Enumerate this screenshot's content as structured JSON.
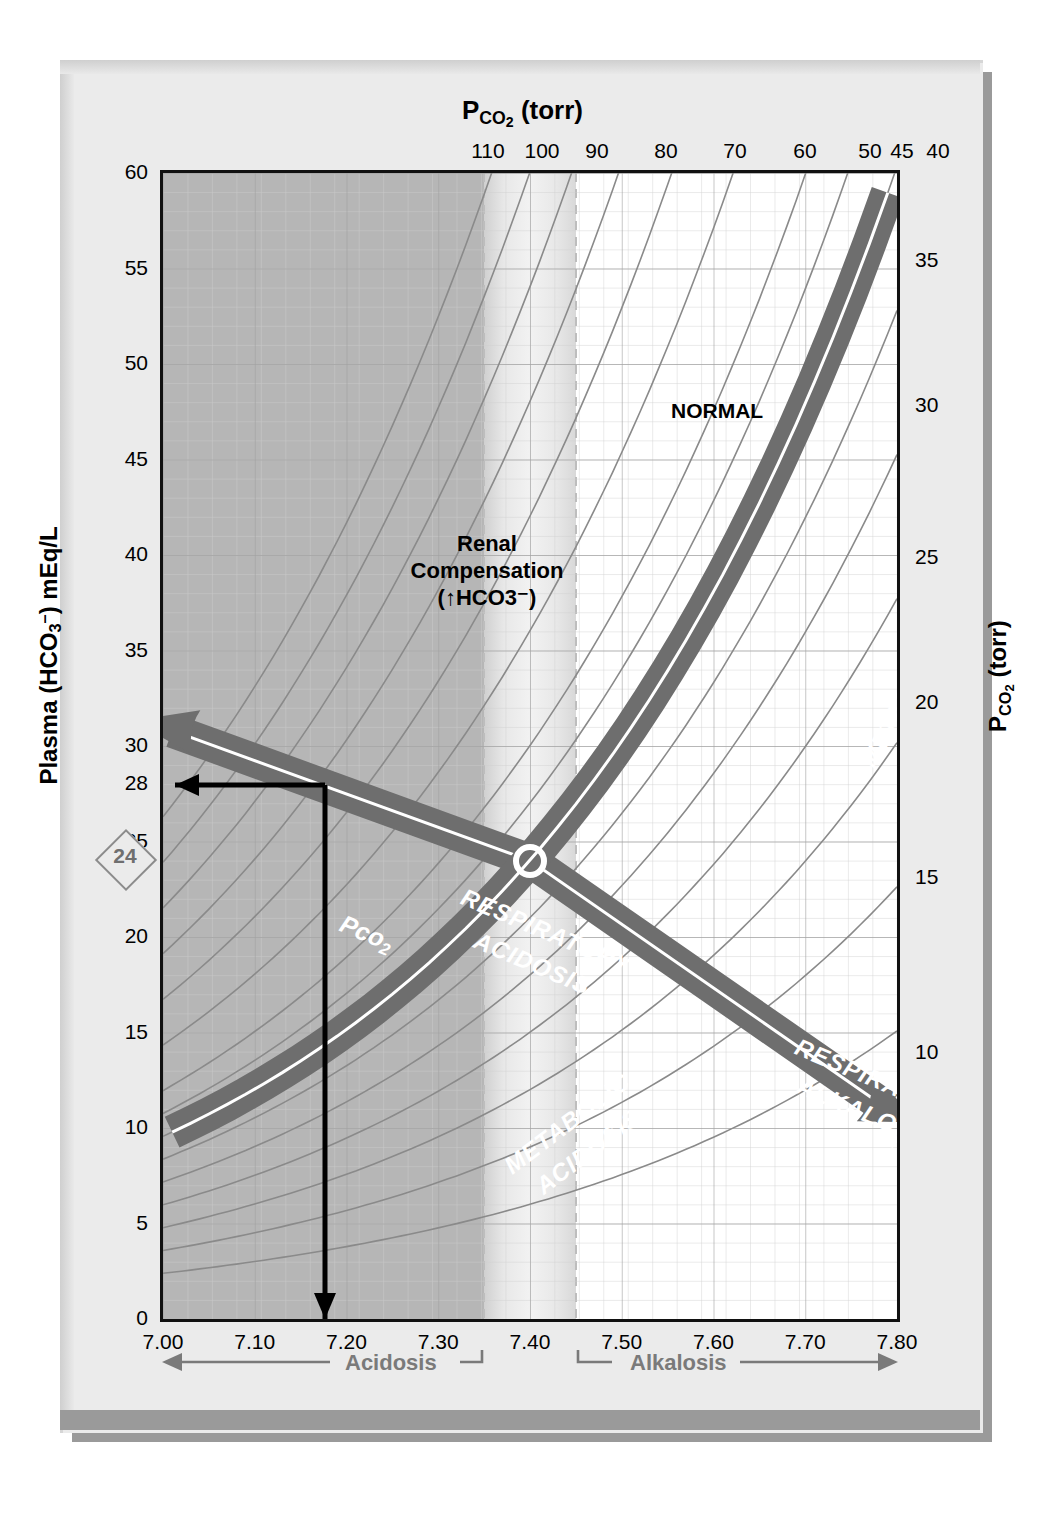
{
  "figure": {
    "kind": "acid-base-nomogram",
    "top_axis_title": "PCO2 (torr)",
    "bottom_axis_title": "Arterial pH",
    "left_axis_title": "Plasma (HCO3-) mEq/L",
    "right_axis_title": "PCO2 (torr)"
  },
  "annotations": {
    "normal_top": "NORMAL",
    "normal_bottom": "NORMAL",
    "renal_line1": "Renal",
    "renal_line2": "Compensation",
    "renal_line3": "(↑HCO3⁻)",
    "marker_value": "24",
    "acidosis": "Acidosis",
    "alkalosis": "Alkalosis",
    "band_respiratory_acidosis_l1": "RESPIRATORY",
    "band_respiratory_acidosis_l2": "ACIDOSIS",
    "band_respiratory_alkalosis_l1": "RESPIRATORY",
    "band_respiratory_alkalosis_l2": "ALKALOSIS",
    "band_metabolic_acidosis_l1": "METABOLIC",
    "band_metabolic_acidosis_l2": "ACIDOSIS",
    "band_metabolic_alkalosis_l1": "METABOLIC",
    "band_metabolic_alkalosis_l2": "ALKALOSIS",
    "arrow_label_left": "Pco2",
    "arrow_label_right": "Pco2"
  },
  "colors": {
    "band": "#6e6e6e",
    "plate": "#ebebeb",
    "shadow": "#9a9a9a",
    "grid_minor": "#c9c9c9",
    "grid_major": "#9e9e9e",
    "isobar": "#8a8a8a",
    "shade_renal": "#a8a8a8",
    "shade_normal": "#e2e2e2",
    "axis": "#111111",
    "construction": "#000000",
    "direction_text": "#7a7a7a"
  },
  "chart_data": {
    "type": "line",
    "xlabel": "Arterial pH",
    "ylabel": "Plasma (HCO3-) mEq/L",
    "xlim": [
      7.0,
      7.8
    ],
    "ylim": [
      0,
      60
    ],
    "grid": true,
    "legend": "none",
    "x_ticks": [
      "7.00",
      "7.10",
      "7.20",
      "7.30",
      "7.40",
      "7.50",
      "7.60",
      "7.70",
      "7.80"
    ],
    "x_tick_values": [
      7.0,
      7.1,
      7.2,
      7.3,
      7.4,
      7.5,
      7.6,
      7.7,
      7.8
    ],
    "y_ticks_left": [
      "0",
      "5",
      "10",
      "15",
      "20",
      "25",
      "28",
      "30",
      "35",
      "40",
      "45",
      "50",
      "55",
      "60"
    ],
    "y_tick_values_left": [
      0,
      5,
      10,
      15,
      20,
      25,
      28,
      30,
      35,
      40,
      45,
      50,
      55,
      60
    ],
    "y_ticks_right": [
      "10",
      "15",
      "20",
      "25",
      "30",
      "35"
    ],
    "y_tick_values_right": [
      10,
      15,
      20,
      25,
      30,
      35
    ],
    "top_axis_label": "PCO2 (torr)",
    "top_ticks": [
      "110",
      "100",
      "90",
      "80",
      "70",
      "60",
      "50",
      "45",
      "40"
    ],
    "top_tick_values": [
      110,
      100,
      90,
      80,
      70,
      60,
      50,
      45,
      40
    ],
    "pco2_isobars_torr": [
      110,
      100,
      90,
      80,
      70,
      60,
      50,
      45,
      40,
      35,
      30,
      25,
      20,
      15,
      10
    ],
    "normal_ph_range": [
      7.35,
      7.45
    ],
    "normal_hco3": 24,
    "normal_pco2": 40,
    "renal_compensation_region_ph": [
      7.0,
      7.35
    ],
    "intersection_point": {
      "ph": 7.4,
      "hco3": 24
    },
    "construction_lines": {
      "hco3_readout": 28,
      "ph_readout": 7.175
    },
    "bands": [
      {
        "name": "RESPIRATORY ACIDOSIS",
        "direction": "up-left",
        "arrow_label": "Pco2"
      },
      {
        "name": "RESPIRATORY ALKALOSIS",
        "direction": "down-right",
        "arrow_label": "Pco2"
      },
      {
        "name": "METABOLIC ACIDOSIS",
        "direction": "down-left"
      },
      {
        "name": "METABOLIC ALKALOSIS",
        "direction": "up-right"
      }
    ]
  }
}
